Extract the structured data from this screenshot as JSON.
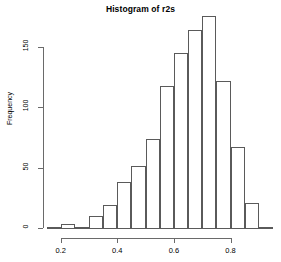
{
  "chart_data": {
    "type": "bar",
    "title": "Histogram of r2s",
    "xlabel": "",
    "ylabel": "Frequency",
    "bin_width": 0.05,
    "bin_starts": [
      0.15,
      0.2,
      0.25,
      0.3,
      0.35,
      0.4,
      0.45,
      0.5,
      0.55,
      0.6,
      0.65,
      0.7,
      0.75,
      0.8,
      0.85,
      0.9
    ],
    "categories": [
      "0.15-0.20",
      "0.20-0.25",
      "0.25-0.30",
      "0.30-0.35",
      "0.35-0.40",
      "0.40-0.45",
      "0.45-0.50",
      "0.50-0.55",
      "0.55-0.60",
      "0.60-0.65",
      "0.65-0.70",
      "0.70-0.75",
      "0.75-0.80",
      "0.80-0.85",
      "0.85-0.90",
      "0.90-0.95"
    ],
    "values": [
      1,
      3,
      1,
      10,
      19,
      38,
      51,
      74,
      118,
      145,
      164,
      176,
      122,
      67,
      21,
      1
    ],
    "xlim": [
      0.15,
      0.95
    ],
    "ylim": [
      0,
      180
    ],
    "xticks": [
      0.2,
      0.4,
      0.6,
      0.8
    ],
    "xtick_labels": [
      "0.2",
      "0.4",
      "0.6",
      "0.8"
    ],
    "yticks": [
      0,
      50,
      100,
      150
    ],
    "ytick_labels": [
      "0",
      "50",
      "100",
      "150"
    ],
    "grid": false,
    "legend": null,
    "bar_edge_color": "#5a5a5a",
    "bar_fill_color": "transparent",
    "axis_color": "#6a6a6a",
    "background_color": "#ffffff"
  }
}
